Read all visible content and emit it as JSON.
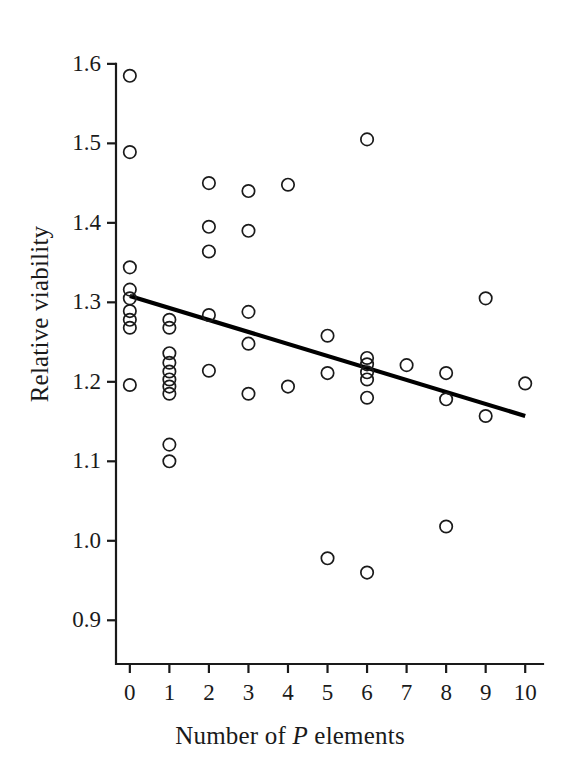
{
  "chart_data": {
    "type": "scatter",
    "title": "",
    "xlabel": "Number of P elements",
    "xlabel_parts": {
      "pre": "Number of ",
      "italic": "P",
      "post": " elements"
    },
    "ylabel": "Relative viability",
    "xlim": [
      -0.35,
      10.45
    ],
    "ylim": [
      0.845,
      1.625
    ],
    "xticks": [
      0,
      1,
      2,
      3,
      4,
      5,
      6,
      7,
      8,
      9,
      10
    ],
    "xtick_labels": [
      "0",
      "1",
      "2",
      "3",
      "4",
      "5",
      "6",
      "7",
      "8",
      "9",
      "10"
    ],
    "yticks": [
      0.9,
      1.0,
      1.1,
      1.2,
      1.3,
      1.4,
      1.5,
      1.6
    ],
    "ytick_labels": [
      "0.9",
      "1.0",
      "1.1",
      "1.2",
      "1.3",
      "1.4",
      "1.5",
      "1.6"
    ],
    "grid": false,
    "legend": null,
    "marker": "open-circle",
    "marker_color": "#1a1a1a",
    "points": [
      {
        "x": 0,
        "y": 1.585
      },
      {
        "x": 0,
        "y": 1.489
      },
      {
        "x": 0,
        "y": 1.344
      },
      {
        "x": 0,
        "y": 1.316
      },
      {
        "x": 0,
        "y": 1.305
      },
      {
        "x": 0,
        "y": 1.289
      },
      {
        "x": 0,
        "y": 1.278
      },
      {
        "x": 0,
        "y": 1.268
      },
      {
        "x": 0,
        "y": 1.196
      },
      {
        "x": 1,
        "y": 1.278
      },
      {
        "x": 1,
        "y": 1.268
      },
      {
        "x": 1,
        "y": 1.236
      },
      {
        "x": 1,
        "y": 1.224
      },
      {
        "x": 1,
        "y": 1.213
      },
      {
        "x": 1,
        "y": 1.203
      },
      {
        "x": 1,
        "y": 1.194
      },
      {
        "x": 1,
        "y": 1.185
      },
      {
        "x": 1,
        "y": 1.121
      },
      {
        "x": 1,
        "y": 1.1
      },
      {
        "x": 2,
        "y": 1.45
      },
      {
        "x": 2,
        "y": 1.395
      },
      {
        "x": 2,
        "y": 1.364
      },
      {
        "x": 2,
        "y": 1.284
      },
      {
        "x": 2,
        "y": 1.214
      },
      {
        "x": 3,
        "y": 1.44
      },
      {
        "x": 3,
        "y": 1.39
      },
      {
        "x": 3,
        "y": 1.288
      },
      {
        "x": 3,
        "y": 1.248
      },
      {
        "x": 3,
        "y": 1.185
      },
      {
        "x": 4,
        "y": 1.448
      },
      {
        "x": 4,
        "y": 1.194
      },
      {
        "x": 5,
        "y": 1.258
      },
      {
        "x": 5,
        "y": 1.211
      },
      {
        "x": 5,
        "y": 0.978
      },
      {
        "x": 6,
        "y": 1.505
      },
      {
        "x": 6,
        "y": 1.23
      },
      {
        "x": 6,
        "y": 1.222
      },
      {
        "x": 6,
        "y": 1.212
      },
      {
        "x": 6,
        "y": 1.203
      },
      {
        "x": 6,
        "y": 1.18
      },
      {
        "x": 6,
        "y": 0.96
      },
      {
        "x": 7,
        "y": 1.221
      },
      {
        "x": 8,
        "y": 1.211
      },
      {
        "x": 8,
        "y": 1.178
      },
      {
        "x": 8,
        "y": 1.018
      },
      {
        "x": 9,
        "y": 1.305
      },
      {
        "x": 9,
        "y": 1.157
      },
      {
        "x": 10,
        "y": 1.198
      }
    ],
    "fit_line": {
      "type": "linear-regression",
      "x_start": 0,
      "y_start": 1.308,
      "x_end": 10,
      "y_end": 1.157,
      "color": "#000000"
    }
  }
}
